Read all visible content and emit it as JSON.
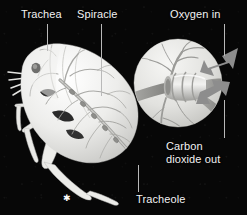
{
  "figure": {
    "background_color": "#070707",
    "label_color": "#f2f2f2",
    "leader_color": "#b9b9b9",
    "body_color": "#e8e8e6",
    "trachea_color": "#9a9a98",
    "arrow_color": "#8d8d8d",
    "width": 247,
    "height": 215
  },
  "labels": [
    {
      "id": "trachea",
      "text": "Trachea",
      "x": 21,
      "y": 8,
      "name": "label-trachea"
    },
    {
      "id": "spiracle",
      "text": "Spiracle",
      "x": 77,
      "y": 8,
      "name": "label-spiracle"
    },
    {
      "id": "oxygen_in",
      "text": "Oxygen in",
      "x": 170,
      "y": 8,
      "name": "label-oxygen-in"
    },
    {
      "id": "carbon_dioxide_out_line1",
      "text": "Carbon",
      "x": 166,
      "y": 140,
      "name": "label-carbon-dioxide-out-line1"
    },
    {
      "id": "carbon_dioxide_out_line2",
      "text": "dioxide out",
      "x": 166,
      "y": 153,
      "name": "label-carbon-dioxide-out-line2"
    },
    {
      "id": "tracheole",
      "text": "Tracheole",
      "x": 136,
      "y": 193,
      "name": "label-tracheole"
    }
  ],
  "leaders": [
    {
      "id": "trachea-leader",
      "x": 47,
      "y": 24,
      "height": 27,
      "name": "leader-line-trachea"
    },
    {
      "id": "spiracle-leader",
      "x": 101,
      "y": 24,
      "height": 72,
      "name": "leader-line-spiracle"
    },
    {
      "id": "oxygen-leader",
      "x": 224,
      "y": 24,
      "height": 32,
      "name": "leader-line-oxygen-in"
    },
    {
      "id": "co2-leader",
      "x": 224,
      "y": 100,
      "height": 38,
      "name": "leader-line-carbon-dioxide-out"
    },
    {
      "id": "tracheole-leader",
      "x": 138,
      "y": 165,
      "height": 27,
      "name": "leader-line-tracheole"
    }
  ],
  "marker": {
    "glyph": "✱",
    "x": 63,
    "y": 194,
    "name": "scale-asterisk-marker"
  },
  "inset": {
    "name": "magnified-trachea-inset",
    "center_x": 178,
    "center_y": 83,
    "radius": 44,
    "description": "Magnified view of a trachea tube with branching tracheoles and gas exchange arrows"
  },
  "arrows": [
    {
      "id": "oxygen-in-arrow",
      "direction": "inward",
      "name": "oxygen-in-arrow"
    },
    {
      "id": "co2-out-arrow",
      "direction": "outward",
      "name": "carbon-dioxide-out-arrow"
    }
  ],
  "subject": {
    "name": "insect-illustration",
    "description": "Grasshopper-like insect shown in cutaway with internal tracheal system"
  }
}
